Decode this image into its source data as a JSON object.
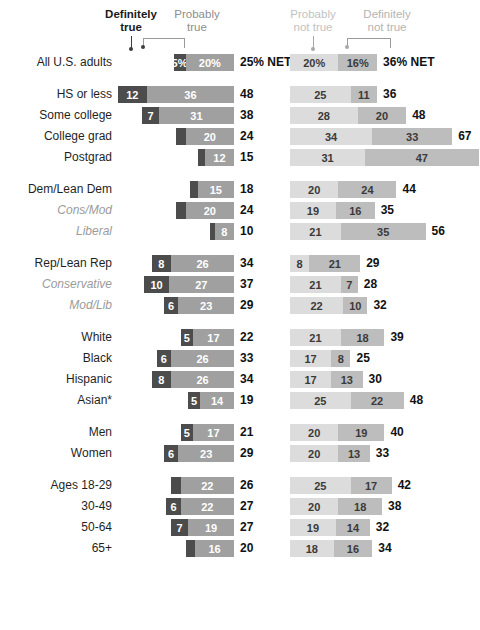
{
  "legend": {
    "definitely_true": "Definitely\ntrue",
    "definitely_true_line1": "Definitely",
    "definitely_true_line2": "true",
    "probably_true_line1": "Probably",
    "probably_true_line2": "true",
    "probably_not_true_line1": "Probably",
    "probably_not_true_line2": "not true",
    "definitely_not_true_line1": "Definitely",
    "definitely_not_true_line2": "not true"
  },
  "colors": {
    "definitely_true": "#4c4c4c",
    "probably_true": "#a0a0a0",
    "probably_not_true": "#dcdcdc",
    "definitely_not_true": "#bdbdbd",
    "net_text": "#111111",
    "sub_label": "#9b9b9b"
  },
  "chart_data": {
    "type": "bar",
    "subtype": "diverging-stacked",
    "title": "",
    "xlabel": "",
    "ylabel": "",
    "units": "%",
    "left_series": [
      {
        "name": "Definitely true",
        "key": "definitely_true",
        "color": "#4c4c4c"
      },
      {
        "name": "Probably true",
        "key": "probably_true",
        "color": "#a0a0a0"
      }
    ],
    "right_series": [
      {
        "name": "Probably not true",
        "key": "probably_not_true",
        "color": "#dcdcdc"
      },
      {
        "name": "Definitely not true",
        "key": "definitely_not_true",
        "color": "#bdbdbd"
      }
    ],
    "net_suffix_first_row": "% NET",
    "rows": [
      {
        "label": "All U.S. adults",
        "sub": false,
        "group_start": false,
        "first": true,
        "definitely_true": 5,
        "probably_true": 20,
        "net_true": 25,
        "probably_not_true": 20,
        "definitely_not_true": 16,
        "net_not_true": 36,
        "definitely_true_display": "5%",
        "probably_true_display": "20%",
        "net_true_display": "25% NET",
        "probably_not_true_display": "20%",
        "definitely_not_true_display": "16%",
        "net_not_true_display": "36% NET"
      },
      {
        "label": "HS or less",
        "sub": false,
        "group_start": true,
        "definitely_true": 12,
        "probably_true": 36,
        "net_true": 48,
        "probably_not_true": 25,
        "definitely_not_true": 11,
        "net_not_true": 36,
        "definitely_true_display": "12",
        "probably_true_display": "36",
        "net_true_display": "48",
        "probably_not_true_display": "25",
        "definitely_not_true_display": "11",
        "net_not_true_display": "36"
      },
      {
        "label": "Some college",
        "sub": false,
        "group_start": false,
        "definitely_true": 7,
        "probably_true": 31,
        "net_true": 38,
        "probably_not_true": 28,
        "definitely_not_true": 20,
        "net_not_true": 48,
        "definitely_true_display": "7",
        "probably_true_display": "31",
        "net_true_display": "38",
        "probably_not_true_display": "28",
        "definitely_not_true_display": "20",
        "net_not_true_display": "48"
      },
      {
        "label": "College grad",
        "sub": false,
        "group_start": false,
        "definitely_true": 4,
        "probably_true": 20,
        "net_true": 24,
        "probably_not_true": 34,
        "definitely_not_true": 33,
        "net_not_true": 67,
        "definitely_true_display": "",
        "probably_true_display": "20",
        "net_true_display": "24",
        "probably_not_true_display": "34",
        "definitely_not_true_display": "33",
        "net_not_true_display": "67"
      },
      {
        "label": "Postgrad",
        "sub": false,
        "group_start": false,
        "definitely_true": 3,
        "probably_true": 12,
        "net_true": 15,
        "probably_not_true": 31,
        "definitely_not_true": 47,
        "net_not_true": 78,
        "definitely_true_display": "",
        "probably_true_display": "12",
        "net_true_display": "15",
        "probably_not_true_display": "31",
        "definitely_not_true_display": "47",
        "net_not_true_display": "78"
      },
      {
        "label": "Dem/Lean Dem",
        "sub": false,
        "group_start": true,
        "definitely_true": 3,
        "probably_true": 15,
        "net_true": 18,
        "probably_not_true": 20,
        "definitely_not_true": 24,
        "net_not_true": 44,
        "definitely_true_display": "",
        "probably_true_display": "15",
        "net_true_display": "18",
        "probably_not_true_display": "20",
        "definitely_not_true_display": "24",
        "net_not_true_display": "44"
      },
      {
        "label": "Cons/Mod",
        "sub": true,
        "group_start": false,
        "definitely_true": 4,
        "probably_true": 20,
        "net_true": 24,
        "probably_not_true": 19,
        "definitely_not_true": 16,
        "net_not_true": 35,
        "definitely_true_display": "",
        "probably_true_display": "20",
        "net_true_display": "24",
        "probably_not_true_display": "19",
        "definitely_not_true_display": "16",
        "net_not_true_display": "35"
      },
      {
        "label": "Liberal",
        "sub": true,
        "group_start": false,
        "definitely_true": 2,
        "probably_true": 8,
        "net_true": 10,
        "probably_not_true": 21,
        "definitely_not_true": 35,
        "net_not_true": 56,
        "definitely_true_display": "",
        "probably_true_display": "8",
        "net_true_display": "10",
        "probably_not_true_display": "21",
        "definitely_not_true_display": "35",
        "net_not_true_display": "56"
      },
      {
        "label": "Rep/Lean Rep",
        "sub": false,
        "group_start": true,
        "definitely_true": 8,
        "probably_true": 26,
        "net_true": 34,
        "probably_not_true": 8,
        "definitely_not_true": 21,
        "net_not_true": 29,
        "definitely_true_display": "8",
        "probably_true_display": "26",
        "net_true_display": "34",
        "probably_not_true_display": "8",
        "definitely_not_true_display": "21",
        "net_not_true_display": "29"
      },
      {
        "label": "Conservative",
        "sub": true,
        "group_start": false,
        "definitely_true": 10,
        "probably_true": 27,
        "net_true": 37,
        "probably_not_true": 21,
        "definitely_not_true": 7,
        "net_not_true": 28,
        "definitely_true_display": "10",
        "probably_true_display": "27",
        "net_true_display": "37",
        "probably_not_true_display": "21",
        "definitely_not_true_display": "7",
        "net_not_true_display": "28"
      },
      {
        "label": "Mod/Lib",
        "sub": true,
        "group_start": false,
        "definitely_true": 6,
        "probably_true": 23,
        "net_true": 29,
        "probably_not_true": 22,
        "definitely_not_true": 10,
        "net_not_true": 32,
        "definitely_true_display": "6",
        "probably_true_display": "23",
        "net_true_display": "29",
        "probably_not_true_display": "22",
        "definitely_not_true_display": "10",
        "net_not_true_display": "32"
      },
      {
        "label": "White",
        "sub": false,
        "group_start": true,
        "definitely_true": 5,
        "probably_true": 17,
        "net_true": 22,
        "probably_not_true": 21,
        "definitely_not_true": 18,
        "net_not_true": 39,
        "definitely_true_display": "5",
        "probably_true_display": "17",
        "net_true_display": "22",
        "probably_not_true_display": "21",
        "definitely_not_true_display": "18",
        "net_not_true_display": "39"
      },
      {
        "label": "Black",
        "sub": false,
        "group_start": false,
        "definitely_true": 6,
        "probably_true": 26,
        "net_true": 33,
        "probably_not_true": 17,
        "definitely_not_true": 8,
        "net_not_true": 25,
        "definitely_true_display": "6",
        "probably_true_display": "26",
        "net_true_display": "33",
        "probably_not_true_display": "17",
        "definitely_not_true_display": "8",
        "net_not_true_display": "25"
      },
      {
        "label": "Hispanic",
        "sub": false,
        "group_start": false,
        "definitely_true": 8,
        "probably_true": 26,
        "net_true": 34,
        "probably_not_true": 17,
        "definitely_not_true": 13,
        "net_not_true": 30,
        "definitely_true_display": "8",
        "probably_true_display": "26",
        "net_true_display": "34",
        "probably_not_true_display": "17",
        "definitely_not_true_display": "13",
        "net_not_true_display": "30"
      },
      {
        "label": "Asian*",
        "sub": false,
        "group_start": false,
        "definitely_true": 5,
        "probably_true": 14,
        "net_true": 19,
        "probably_not_true": 25,
        "definitely_not_true": 22,
        "net_not_true": 48,
        "definitely_true_display": "5",
        "probably_true_display": "14",
        "net_true_display": "19",
        "probably_not_true_display": "25",
        "definitely_not_true_display": "22",
        "net_not_true_display": "48"
      },
      {
        "label": "Men",
        "sub": false,
        "group_start": true,
        "definitely_true": 5,
        "probably_true": 17,
        "net_true": 21,
        "probably_not_true": 20,
        "definitely_not_true": 19,
        "net_not_true": 40,
        "definitely_true_display": "5",
        "probably_true_display": "17",
        "net_true_display": "21",
        "probably_not_true_display": "20",
        "definitely_not_true_display": "19",
        "net_not_true_display": "40"
      },
      {
        "label": "Women",
        "sub": false,
        "group_start": false,
        "definitely_true": 6,
        "probably_true": 23,
        "net_true": 29,
        "probably_not_true": 20,
        "definitely_not_true": 13,
        "net_not_true": 33,
        "definitely_true_display": "6",
        "probably_true_display": "23",
        "net_true_display": "29",
        "probably_not_true_display": "20",
        "definitely_not_true_display": "13",
        "net_not_true_display": "33"
      },
      {
        "label": "Ages 18-29",
        "sub": false,
        "group_start": true,
        "definitely_true": 4,
        "probably_true": 22,
        "net_true": 26,
        "probably_not_true": 25,
        "definitely_not_true": 17,
        "net_not_true": 42,
        "definitely_true_display": "",
        "probably_true_display": "22",
        "net_true_display": "26",
        "probably_not_true_display": "25",
        "definitely_not_true_display": "17",
        "net_not_true_display": "42"
      },
      {
        "label": "30-49",
        "sub": false,
        "group_start": false,
        "definitely_true": 6,
        "probably_true": 22,
        "net_true": 27,
        "probably_not_true": 20,
        "definitely_not_true": 18,
        "net_not_true": 38,
        "definitely_true_display": "6",
        "probably_true_display": "22",
        "net_true_display": "27",
        "probably_not_true_display": "20",
        "definitely_not_true_display": "18",
        "net_not_true_display": "38"
      },
      {
        "label": "50-64",
        "sub": false,
        "group_start": false,
        "definitely_true": 7,
        "probably_true": 19,
        "net_true": 27,
        "probably_not_true": 19,
        "definitely_not_true": 14,
        "net_not_true": 32,
        "definitely_true_display": "7",
        "probably_true_display": "19",
        "net_true_display": "27",
        "probably_not_true_display": "19",
        "definitely_not_true_display": "14",
        "net_not_true_display": "32"
      },
      {
        "label": "65+",
        "sub": false,
        "group_start": false,
        "definitely_true": 4,
        "probably_true": 16,
        "net_true": 20,
        "probably_not_true": 18,
        "definitely_not_true": 16,
        "net_not_true": 34,
        "definitely_true_display": "",
        "probably_true_display": "16",
        "net_true_display": "20",
        "probably_not_true_display": "18",
        "definitely_not_true_display": "16",
        "net_not_true_display": "34"
      }
    ]
  }
}
